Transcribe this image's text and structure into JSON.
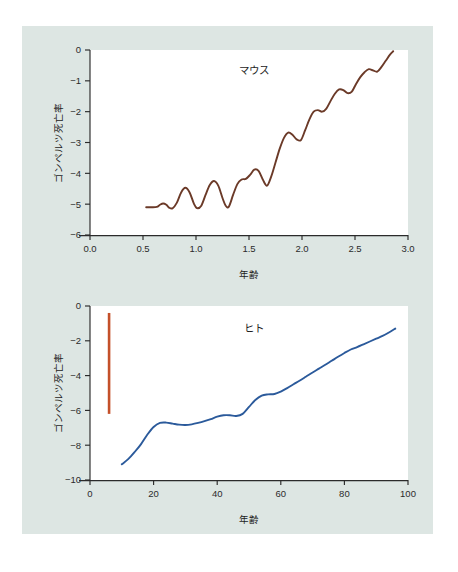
{
  "figure": {
    "background_color": "#dde6e3",
    "page_background": "#ffffff"
  },
  "charts": [
    {
      "id": "mouse",
      "title": "マウス",
      "xlabel": "年齢",
      "ylabel": "ゴンペルツ死亡率",
      "line_color": "#6b3a28",
      "xticks": [
        "0.0",
        "0.5",
        "1.0",
        "1.5",
        "2.0",
        "2.5",
        "3.0"
      ],
      "yticks": [
        "0",
        "−1",
        "−2",
        "−3",
        "−4",
        "−5",
        "−6"
      ]
    },
    {
      "id": "human",
      "title": "ヒト",
      "xlabel": "年齢",
      "ylabel": "ゴンペルツ死亡率",
      "line_color": "#2b5a9b",
      "marker_color": "#c4502a",
      "xticks": [
        "0",
        "20",
        "40",
        "60",
        "80",
        "100"
      ],
      "yticks": [
        "0",
        "−2",
        "−4",
        "−6",
        "−8",
        "−10"
      ]
    }
  ],
  "chart_data": [
    {
      "type": "line",
      "id": "mouse",
      "title": "マウス",
      "xlabel": "年齢",
      "ylabel": "ゴンペルツ死亡率",
      "xlim": [
        0.0,
        3.0
      ],
      "ylim": [
        -6,
        0
      ],
      "xticks": [
        0.0,
        0.5,
        1.0,
        1.5,
        2.0,
        2.5,
        3.0
      ],
      "yticks": [
        0,
        -1,
        -2,
        -3,
        -4,
        -5,
        -6
      ],
      "grid": false,
      "legend": "none",
      "series": [
        {
          "name": "マウス ゴンペルツ死亡率",
          "color": "#6b3a28",
          "x": [
            0.53,
            0.58,
            0.63,
            0.66,
            0.69,
            0.72,
            0.75,
            0.78,
            0.82,
            0.86,
            0.9,
            0.94,
            0.98,
            1.01,
            1.05,
            1.09,
            1.13,
            1.17,
            1.21,
            1.25,
            1.28,
            1.31,
            1.35,
            1.39,
            1.43,
            1.47,
            1.51,
            1.55,
            1.59,
            1.63,
            1.67,
            1.71,
            1.75,
            1.79,
            1.83,
            1.87,
            1.91,
            1.95,
            1.99,
            2.03,
            2.07,
            2.11,
            2.15,
            2.19,
            2.23,
            2.27,
            2.31,
            2.35,
            2.39,
            2.43,
            2.47,
            2.51,
            2.55,
            2.59,
            2.63,
            2.67,
            2.71,
            2.75,
            2.79,
            2.83,
            2.86
          ],
          "y": [
            -5.1,
            -5.1,
            -5.09,
            -5.02,
            -4.98,
            -5.02,
            -5.12,
            -5.13,
            -4.95,
            -4.62,
            -4.47,
            -4.62,
            -4.98,
            -5.13,
            -5.05,
            -4.7,
            -4.38,
            -4.25,
            -4.4,
            -4.8,
            -5.05,
            -5.08,
            -4.7,
            -4.35,
            -4.2,
            -4.18,
            -4.05,
            -3.88,
            -3.92,
            -4.2,
            -4.4,
            -4.1,
            -3.65,
            -3.2,
            -2.85,
            -2.68,
            -2.75,
            -2.9,
            -2.92,
            -2.6,
            -2.25,
            -2.0,
            -1.95,
            -2.0,
            -1.9,
            -1.65,
            -1.42,
            -1.28,
            -1.3,
            -1.4,
            -1.35,
            -1.1,
            -0.88,
            -0.72,
            -0.62,
            -0.66,
            -0.7,
            -0.55,
            -0.35,
            -0.15,
            -0.04
          ]
        }
      ]
    },
    {
      "type": "line",
      "id": "human",
      "title": "ヒト",
      "xlabel": "年齢",
      "ylabel": "ゴンペルツ死亡率",
      "xlim": [
        0,
        100
      ],
      "ylim": [
        -10,
        0
      ],
      "xticks": [
        0,
        20,
        40,
        60,
        80,
        100
      ],
      "yticks": [
        0,
        -2,
        -4,
        -6,
        -8,
        -10
      ],
      "grid": false,
      "legend": "none",
      "series": [
        {
          "name": "ヒト ゴンペルツ死亡率",
          "color": "#2b5a9b",
          "x": [
            10,
            12,
            14,
            16,
            18,
            20,
            22,
            24,
            26,
            28,
            30,
            32,
            34,
            36,
            38,
            40,
            42,
            44,
            46,
            48,
            50,
            52,
            54,
            56,
            58,
            60,
            62,
            64,
            66,
            68,
            70,
            72,
            74,
            76,
            78,
            80,
            82,
            84,
            86,
            88,
            90,
            92,
            94,
            96
          ],
          "y": [
            -9.1,
            -8.8,
            -8.4,
            -7.95,
            -7.4,
            -6.95,
            -6.72,
            -6.7,
            -6.76,
            -6.82,
            -6.84,
            -6.8,
            -6.72,
            -6.62,
            -6.5,
            -6.36,
            -6.28,
            -6.28,
            -6.32,
            -6.2,
            -5.8,
            -5.4,
            -5.15,
            -5.08,
            -5.06,
            -4.92,
            -4.72,
            -4.5,
            -4.28,
            -4.05,
            -3.82,
            -3.6,
            -3.38,
            -3.15,
            -2.92,
            -2.7,
            -2.5,
            -2.36,
            -2.2,
            -2.04,
            -1.88,
            -1.72,
            -1.52,
            -1.3
          ]
        }
      ],
      "annotations": [
        {
          "name": "mouse-lifespan-reference-bar",
          "type": "vertical-bar",
          "color": "#c4502a",
          "x": 6,
          "y_top": -0.4,
          "y_bottom": -6.2
        }
      ]
    }
  ]
}
